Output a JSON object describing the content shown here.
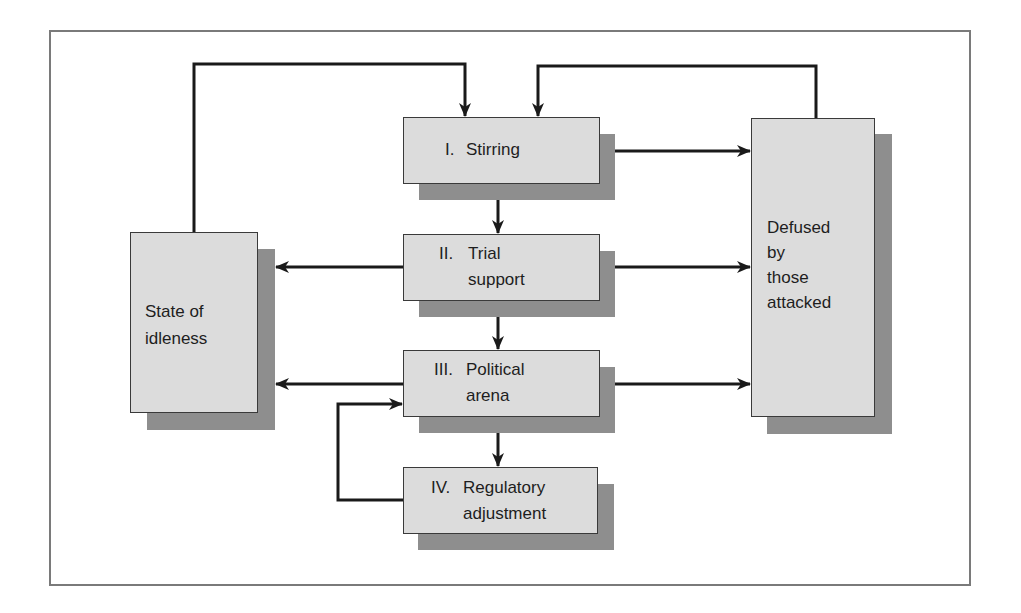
{
  "diagram": {
    "title": "",
    "nodes": {
      "stirring": {
        "numeral": "I.",
        "line1": "Stirring",
        "line2": ""
      },
      "trial_support": {
        "numeral": "II.",
        "line1": "Trial",
        "line2": "support"
      },
      "political_arena": {
        "numeral": "III.",
        "line1": "Political",
        "line2": "arena"
      },
      "regulatory_adjustment": {
        "numeral": "IV.",
        "line1": "Regulatory",
        "line2": "adjustment"
      },
      "state_of_idleness": {
        "lines": [
          "State of",
          "idleness"
        ]
      },
      "defused": {
        "lines": [
          "Defused",
          "by",
          "those",
          "attacked"
        ]
      }
    },
    "edges": [
      {
        "from": "state_of_idleness",
        "to": "stirring"
      },
      {
        "from": "defused",
        "to": "stirring"
      },
      {
        "from": "stirring",
        "to": "defused"
      },
      {
        "from": "stirring",
        "to": "trial_support"
      },
      {
        "from": "trial_support",
        "to": "state_of_idleness"
      },
      {
        "from": "trial_support",
        "to": "defused"
      },
      {
        "from": "trial_support",
        "to": "political_arena"
      },
      {
        "from": "political_arena",
        "to": "state_of_idleness"
      },
      {
        "from": "political_arena",
        "to": "defused"
      },
      {
        "from": "political_arena",
        "to": "regulatory_adjustment"
      },
      {
        "from": "regulatory_adjustment",
        "to": "political_arena"
      }
    ],
    "colors": {
      "box_fill": "#dcdcdc",
      "box_shadow": "#8e8e8e",
      "arrow": "#1a1a1a",
      "frame": "#7a7a7a"
    }
  }
}
